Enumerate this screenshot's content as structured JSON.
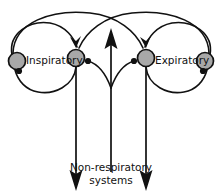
{
  "diagram": {
    "background_color": "#ffffff",
    "line_color": "#111111",
    "node_fill_color": "#a8a8a8",
    "labels": {
      "inspiratory": "Inspiratory",
      "expiratory": "Expiratory",
      "caption_line1": "Non-respiratory",
      "caption_line2": "systems"
    },
    "nodes": [
      {
        "id": "outer-left",
        "name": "outer-left-neuron",
        "cx": 17,
        "cy": 61,
        "r": 8.5
      },
      {
        "id": "inner-left",
        "name": "inner-left-neuron",
        "cx": 76,
        "cy": 58,
        "r": 8.5
      },
      {
        "id": "inner-right",
        "name": "inner-right-neuron",
        "cx": 146,
        "cy": 58,
        "r": 8.5
      },
      {
        "id": "outer-right",
        "name": "outer-right-neuron",
        "cx": 205,
        "cy": 61,
        "r": 8.5
      }
    ],
    "vertical_projections": [
      {
        "name": "left-descending-axon",
        "x": 76,
        "direction": "down"
      },
      {
        "name": "center-ascending-axon",
        "x": 111,
        "direction": "up"
      },
      {
        "name": "right-descending-axon",
        "x": 146,
        "direction": "down"
      }
    ]
  }
}
